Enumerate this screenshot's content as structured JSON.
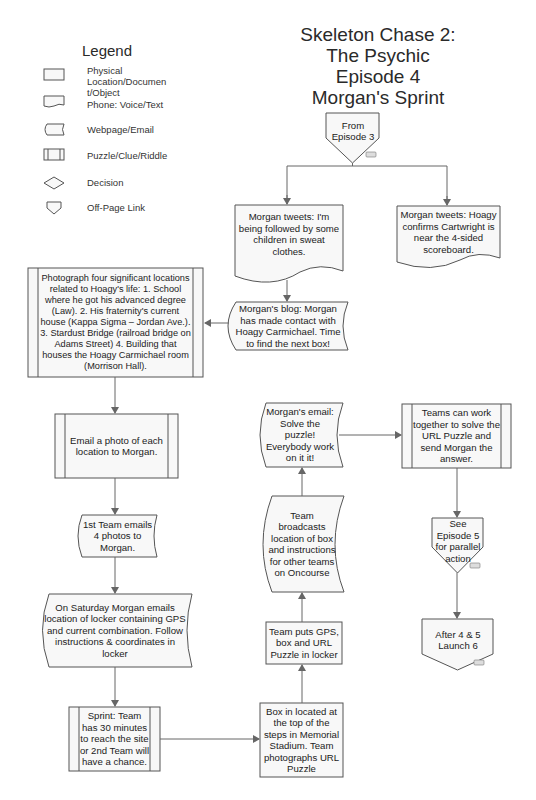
{
  "title": {
    "lines": [
      "Skeleton Chase 2:",
      "The Psychic",
      "Episode 4",
      "Morgan's Sprint"
    ]
  },
  "legend": {
    "title": "Legend",
    "items": [
      {
        "shape": "rectangle",
        "label": "Physical Location/Documen t/Object"
      },
      {
        "shape": "document-wave",
        "label": "Phone: Voice/Text"
      },
      {
        "shape": "stored-data",
        "label": "Webpage/Email"
      },
      {
        "shape": "predefined-process",
        "label": "Puzzle/Clue/Riddle"
      },
      {
        "shape": "diamond",
        "label": "Decision"
      },
      {
        "shape": "off-page-connector",
        "label": "Off-Page Link"
      }
    ]
  },
  "nodes": {
    "from_ep3": {
      "type": "off-page",
      "text": "From Episode 3"
    },
    "tweet_followed": {
      "type": "phone",
      "text": "Morgan tweets: I'm being followed by some children in sweat clothes."
    },
    "tweet_hoagy": {
      "type": "phone",
      "text": "Morgan tweets: Hoagy confirms Cartwright is near the 4-sided scoreboard."
    },
    "blog": {
      "type": "webpage",
      "text": "Morgan's blog: Morgan has made contact with Hoagy Carmichael. Time to find the next box!"
    },
    "photograph": {
      "type": "puzzle",
      "text": "Photograph four significant locations related to  Hoagy's life: 1. School where he got his advanced degree (Law). 2. His fraternity's current house (Kappa Sigma – Jordan Ave.). 3. Stardust Bridge (railroad bridge on Adams Street) 4. Building that houses the Hoagy Carmichael room (Morrison Hall)."
    },
    "email_photo": {
      "type": "puzzle",
      "text": "Email a photo of each location to Morgan."
    },
    "first_team": {
      "type": "webpage",
      "text": "1st Team emails 4 photos to Morgan."
    },
    "saturday": {
      "type": "webpage",
      "text": "On Saturday Morgan emails location of locker containing GPS and current combination. Follow instructions & coordinates in locker"
    },
    "sprint": {
      "type": "puzzle",
      "text": "Sprint: Team has 30 minutes to reach the site or 2nd Team will have a chance."
    },
    "box_located": {
      "type": "physical",
      "text": "Box in located at the top of the steps in Memorial Stadium. Team photographs URL Puzzle"
    },
    "team_puts": {
      "type": "physical",
      "text": "Team puts GPS, box and URL Puzzle in locker"
    },
    "team_broadcasts": {
      "type": "webpage",
      "text": "Team broadcasts location of box and instructions for other teams on Oncourse"
    },
    "morgan_email": {
      "type": "webpage",
      "text": "Morgan's email: Solve the puzzle! Everybody work on it it!"
    },
    "teams_work": {
      "type": "puzzle",
      "text": "Teams can work together to solve the URL Puzzle and send Morgan the answer."
    },
    "see_ep5": {
      "type": "off-page",
      "text": "See Episode 5 for parallel action"
    },
    "after_4_5": {
      "type": "off-page",
      "text": "After 4 & 5 Launch 6"
    }
  },
  "colors": {
    "stroke": "#555555",
    "fill": "#f8f8f8",
    "arrow": "#666666"
  }
}
